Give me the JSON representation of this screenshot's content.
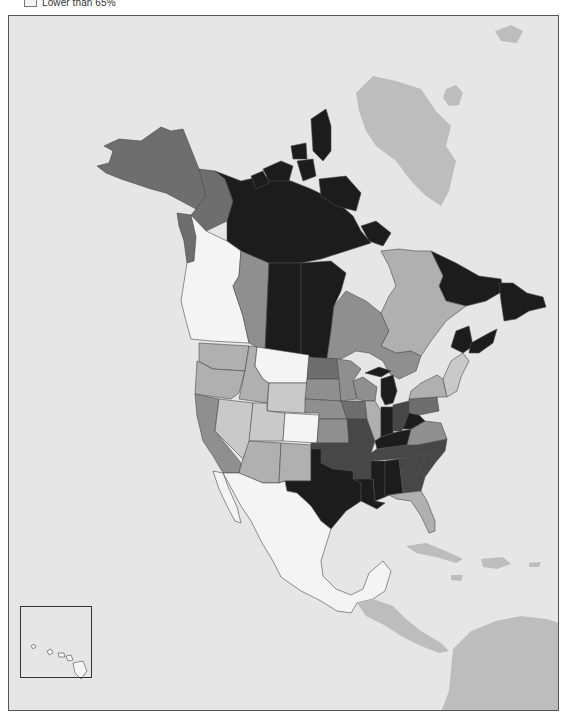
{
  "legend": {
    "entries": [
      {
        "label": "Lower than 65%",
        "color": "#f4f4f4"
      }
    ]
  },
  "map": {
    "title": "",
    "background": "#e6e6e6",
    "tiers": {
      "t1": "#1c1c1c",
      "t2": "#474747",
      "t3": "#6e6e6e",
      "t4": "#8f8f8f",
      "t5": "#b0b0b0",
      "t6": "#c9c9c9",
      "t7": "#f4f4f4",
      "other": "#bdbdbd"
    },
    "inset": {
      "label": "Hawaii",
      "tier": "t7"
    },
    "regions": [
      {
        "name": "Alaska",
        "tier": "t3"
      },
      {
        "name": "Yukon",
        "tier": "t3"
      },
      {
        "name": "Northwest Territories",
        "tier": "t1"
      },
      {
        "name": "Nunavut",
        "tier": "t1"
      },
      {
        "name": "British Columbia",
        "tier": "t7"
      },
      {
        "name": "Alberta",
        "tier": "t4"
      },
      {
        "name": "Saskatchewan",
        "tier": "t1"
      },
      {
        "name": "Manitoba",
        "tier": "t1"
      },
      {
        "name": "Ontario",
        "tier": "t4"
      },
      {
        "name": "Quebec",
        "tier": "t5"
      },
      {
        "name": "Newfoundland and Labrador",
        "tier": "t1"
      },
      {
        "name": "New Brunswick",
        "tier": "t1"
      },
      {
        "name": "Nova Scotia",
        "tier": "t1"
      },
      {
        "name": "Washington",
        "tier": "t5"
      },
      {
        "name": "Oregon",
        "tier": "t5"
      },
      {
        "name": "California",
        "tier": "t4"
      },
      {
        "name": "Idaho",
        "tier": "t5"
      },
      {
        "name": "Nevada",
        "tier": "t6"
      },
      {
        "name": "Montana",
        "tier": "t7"
      },
      {
        "name": "Wyoming",
        "tier": "t6"
      },
      {
        "name": "Utah",
        "tier": "t6"
      },
      {
        "name": "Colorado",
        "tier": "t7"
      },
      {
        "name": "Arizona",
        "tier": "t5"
      },
      {
        "name": "New Mexico",
        "tier": "t5"
      },
      {
        "name": "North Dakota",
        "tier": "t3"
      },
      {
        "name": "South Dakota",
        "tier": "t4"
      },
      {
        "name": "Nebraska",
        "tier": "t4"
      },
      {
        "name": "Kansas",
        "tier": "t4"
      },
      {
        "name": "Oklahoma",
        "tier": "t2"
      },
      {
        "name": "Texas",
        "tier": "t1"
      },
      {
        "name": "Minnesota",
        "tier": "t4"
      },
      {
        "name": "Iowa",
        "tier": "t3"
      },
      {
        "name": "Missouri",
        "tier": "t2"
      },
      {
        "name": "Arkansas",
        "tier": "t2"
      },
      {
        "name": "Louisiana",
        "tier": "t1"
      },
      {
        "name": "Wisconsin",
        "tier": "t4"
      },
      {
        "name": "Illinois",
        "tier": "t5"
      },
      {
        "name": "Michigan",
        "tier": "t1"
      },
      {
        "name": "Indiana",
        "tier": "t1"
      },
      {
        "name": "Ohio",
        "tier": "t2"
      },
      {
        "name": "Kentucky",
        "tier": "t1"
      },
      {
        "name": "Tennessee",
        "tier": "t2"
      },
      {
        "name": "Mississippi",
        "tier": "t1"
      },
      {
        "name": "Alabama",
        "tier": "t1"
      },
      {
        "name": "Georgia",
        "tier": "t2"
      },
      {
        "name": "Florida",
        "tier": "t5"
      },
      {
        "name": "South Carolina",
        "tier": "t2"
      },
      {
        "name": "North Carolina",
        "tier": "t2"
      },
      {
        "name": "Virginia",
        "tier": "t4"
      },
      {
        "name": "West Virginia",
        "tier": "t1"
      },
      {
        "name": "Pennsylvania",
        "tier": "t3"
      },
      {
        "name": "New York",
        "tier": "t5"
      },
      {
        "name": "New England",
        "tier": "t6"
      },
      {
        "name": "Mexico",
        "tier": "t7"
      },
      {
        "name": "Greenland",
        "tier": "other"
      },
      {
        "name": "Central America",
        "tier": "other"
      },
      {
        "name": "Caribbean",
        "tier": "other"
      },
      {
        "name": "South America",
        "tier": "other"
      }
    ]
  }
}
